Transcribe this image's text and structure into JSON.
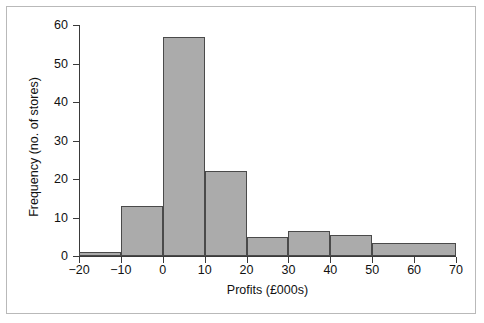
{
  "figure": {
    "frame_border_color": "#b9b9b9",
    "background": "#ffffff"
  },
  "chart_data": {
    "type": "bar",
    "title": "",
    "xlabel": "Profits (£000s)",
    "ylabel": "Frequency (no. of stores)",
    "xlim": [
      -20,
      70
    ],
    "ylim": [
      0,
      60
    ],
    "xticks": [
      -20,
      -10,
      0,
      10,
      20,
      30,
      40,
      50,
      60,
      70
    ],
    "xtick_labels": [
      "−20",
      "−10",
      "0",
      "10",
      "20",
      "30",
      "40",
      "50",
      "60",
      "70"
    ],
    "yticks": [
      0,
      10,
      20,
      30,
      40,
      50,
      60
    ],
    "ytick_labels": [
      "0",
      "10",
      "20",
      "30",
      "40",
      "50",
      "60"
    ],
    "grid": false,
    "legend": null,
    "bar_fill_color": "#ababab",
    "bar_edge_color": "#4a4a4a",
    "bins": [
      {
        "label": "-20 to -10",
        "x0": -20,
        "x1": -10,
        "value": 1
      },
      {
        "label": "-10 to 0",
        "x0": -10,
        "x1": 0,
        "value": 13
      },
      {
        "label": "0 to 10",
        "x0": 0,
        "x1": 10,
        "value": 57
      },
      {
        "label": "10 to 20",
        "x0": 10,
        "x1": 20,
        "value": 22
      },
      {
        "label": "20 to 30",
        "x0": 20,
        "x1": 30,
        "value": 5
      },
      {
        "label": "30 to 40",
        "x0": 30,
        "x1": 40,
        "value": 6.5
      },
      {
        "label": "40 to 50",
        "x0": 40,
        "x1": 50,
        "value": 5.5
      },
      {
        "label": "50 to 70",
        "x0": 50,
        "x1": 70,
        "value": 3.5
      }
    ]
  }
}
